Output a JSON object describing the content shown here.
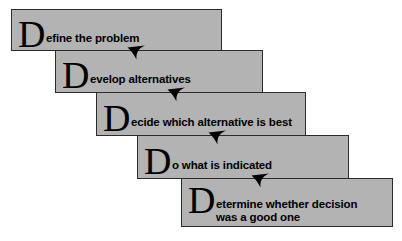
{
  "diagram": {
    "type": "staircase-flow",
    "box_fill_color": "#b3b3b3",
    "box_border_color": "#2b2b2b",
    "background_color": "#ffffff",
    "arrow_color": "#000000",
    "steps": [
      {
        "order": 1,
        "dropcap": "D",
        "text": "efine the problem",
        "full_text": "Define the problem",
        "x": 11,
        "y": 9,
        "width": 211,
        "height": 42
      },
      {
        "order": 2,
        "dropcap": "D",
        "text": "evelop alternatives",
        "full_text": "Develop alternatives",
        "x": 55,
        "y": 50,
        "width": 208,
        "height": 43
      },
      {
        "order": 3,
        "dropcap": "D",
        "text": "ecide which alternative is best",
        "full_text": "Decide which alternative is best",
        "x": 96,
        "y": 92,
        "width": 210,
        "height": 44
      },
      {
        "order": 4,
        "dropcap": "D",
        "text": "o what is indicated",
        "full_text": "Do what is indicated",
        "x": 137,
        "y": 135,
        "width": 212,
        "height": 44
      },
      {
        "order": 5,
        "dropcap": "D",
        "text": "etermine whether decision\nwas a good one",
        "full_text": "Determine whether decision was a good one",
        "x": 181,
        "y": 178,
        "width": 212,
        "height": 49
      }
    ],
    "arrows": [
      {
        "name": "arrow-step1-to-step2",
        "x": 125,
        "y": 40,
        "icon": "arrowhead-down-left-icon"
      },
      {
        "name": "arrow-step2-to-step3",
        "x": 165,
        "y": 82,
        "icon": "arrowhead-down-left-icon"
      },
      {
        "name": "arrow-step3-to-step4",
        "x": 206,
        "y": 125,
        "icon": "arrowhead-down-left-icon"
      },
      {
        "name": "arrow-step4-to-step5",
        "x": 249,
        "y": 168,
        "icon": "arrowhead-down-left-icon"
      }
    ]
  }
}
